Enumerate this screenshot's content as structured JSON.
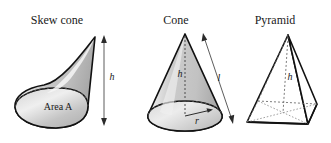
{
  "figure": {
    "background_color": "#ffffff",
    "outline_color": "#1a1a1a",
    "solid_fill_color": "#c8c8c8",
    "highlight_color": "#f2f2f2",
    "shadow_color": "#9a9a9a",
    "hidden_edge_color": "#6e6e6e"
  },
  "shapes": [
    {
      "id": "skew-cone",
      "title": "Skew cone",
      "title_pos": {
        "x": 57,
        "y": 24
      },
      "labels": [
        {
          "name": "base-area-label",
          "text": "Area A",
          "x": 58,
          "y": 110,
          "style": "area"
        },
        {
          "name": "height-label",
          "text": "h",
          "x": 112,
          "y": 80,
          "style": "var"
        }
      ],
      "dimension_arrows": [
        {
          "name": "height-arrow",
          "orientation": "vertical",
          "x1": 104,
          "y1": 37,
          "x2": 104,
          "y2": 124
        }
      ]
    },
    {
      "id": "cone",
      "title": "Cone",
      "title_pos": {
        "x": 170,
        "y": 24
      },
      "labels": [
        {
          "name": "height-label",
          "text": "h",
          "x": 181,
          "y": 76,
          "style": "var"
        },
        {
          "name": "slant-height-label",
          "text": "l",
          "x": 218,
          "y": 80,
          "style": "var"
        },
        {
          "name": "radius-label",
          "text": "r",
          "x": 196,
          "y": 124,
          "style": "var"
        }
      ],
      "dimension_arrows": [
        {
          "name": "slant-height-arrow",
          "orientation": "diagonal",
          "x1": 203,
          "y1": 33,
          "x2": 235,
          "y2": 122
        }
      ]
    },
    {
      "id": "pyramid",
      "title": "Pyramid",
      "title_pos": {
        "x": 268,
        "y": 24
      },
      "labels": [
        {
          "name": "height-label",
          "text": "h",
          "x": 288,
          "y": 79,
          "style": "var"
        }
      ],
      "dimension_arrows": []
    }
  ]
}
